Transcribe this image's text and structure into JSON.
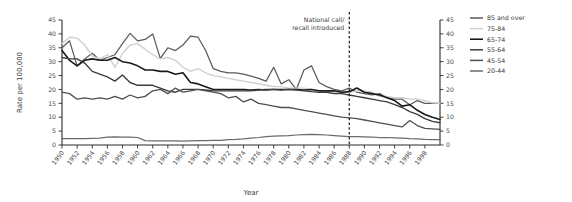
{
  "chart_data": {
    "type": "line",
    "title": "",
    "xlabel": "Year",
    "ylabel": "Rate per 100,000",
    "ylabel_right": "",
    "xlim": [
      1950,
      2000
    ],
    "ylim": [
      0,
      45
    ],
    "yticks": [
      0,
      5,
      10,
      15,
      20,
      25,
      30,
      35,
      40,
      45
    ],
    "xticks": [
      1950,
      1952,
      1954,
      1956,
      1958,
      1960,
      1962,
      1964,
      1966,
      1968,
      1970,
      1972,
      1974,
      1976,
      1978,
      1980,
      1982,
      1984,
      1986,
      1988,
      1990,
      1992,
      1994,
      1996,
      1998
    ],
    "grid": false,
    "legend_position": "top-right",
    "dual_y_axis": true,
    "x": [
      1950,
      1951,
      1952,
      1953,
      1954,
      1955,
      1956,
      1957,
      1958,
      1959,
      1960,
      1961,
      1962,
      1963,
      1964,
      1965,
      1966,
      1967,
      1968,
      1969,
      1970,
      1971,
      1972,
      1973,
      1974,
      1975,
      1976,
      1977,
      1978,
      1979,
      1980,
      1981,
      1982,
      1983,
      1984,
      1985,
      1986,
      1987,
      1988,
      1989,
      1990,
      1991,
      1992,
      1993,
      1994,
      1995,
      1996,
      1997,
      1998,
      1999,
      2000
    ],
    "series": [
      {
        "name": "85 and over",
        "color": "#5a5a5a",
        "width": 1.25,
        "values": [
          35.0,
          37.5,
          28.5,
          31.0,
          33.0,
          30.5,
          31.5,
          32.5,
          36.5,
          40.2,
          37.5,
          38.0,
          40.0,
          31.2,
          35.0,
          34.0,
          36.0,
          39.2,
          38.8,
          34.0,
          27.5,
          26.5,
          26.0,
          26.0,
          25.5,
          24.8,
          24.0,
          23.0,
          28.0,
          22.0,
          23.5,
          20.0,
          27.0,
          28.5,
          22.5,
          21.0,
          20.0,
          19.5,
          20.5,
          19.0,
          18.5,
          18.0,
          18.5,
          17.0,
          16.5,
          16.5,
          14.5,
          16.0,
          15.0,
          15.0,
          15.0
        ]
      },
      {
        "name": "75-84",
        "color": "#cfcfcf",
        "width": 1.35,
        "values": [
          36.5,
          38.8,
          38.5,
          36.0,
          32.0,
          31.0,
          32.5,
          28.0,
          33.0,
          36.0,
          36.5,
          34.5,
          32.5,
          31.0,
          31.5,
          30.5,
          28.0,
          26.5,
          27.5,
          26.0,
          25.0,
          24.5,
          24.0,
          23.5,
          23.0,
          22.5,
          22.0,
          21.5,
          21.0,
          21.0,
          20.5,
          20.5,
          20.5,
          20.0,
          19.5,
          19.5,
          19.0,
          19.0,
          19.0,
          19.5,
          19.5,
          19.0,
          17.5,
          17.5,
          17.0,
          17.0,
          16.5,
          16.5,
          16.0,
          15.2,
          15.0
        ]
      },
      {
        "name": "65-74",
        "color": "#1a1a1a",
        "width": 1.6,
        "values": [
          34.0,
          30.5,
          28.5,
          30.5,
          31.0,
          30.5,
          30.5,
          31.5,
          30.0,
          29.5,
          28.5,
          27.0,
          27.0,
          26.5,
          26.5,
          25.5,
          26.0,
          22.5,
          22.0,
          21.0,
          20.0,
          20.0,
          20.0,
          20.0,
          20.0,
          19.8,
          20.0,
          19.8,
          20.0,
          20.0,
          20.0,
          20.0,
          19.8,
          20.0,
          19.5,
          19.5,
          19.5,
          19.0,
          19.2,
          20.5,
          19.0,
          18.5,
          18.0,
          17.0,
          16.0,
          14.0,
          14.5,
          12.5,
          11.0,
          10.0,
          9.2
        ]
      },
      {
        "name": "55-64",
        "color": "#3c3c3c",
        "width": 1.35,
        "values": [
          31.5,
          31.0,
          31.0,
          29.5,
          26.5,
          25.5,
          24.5,
          23.0,
          25.2,
          22.5,
          21.5,
          21.5,
          21.5,
          20.5,
          19.5,
          19.0,
          20.0,
          20.0,
          20.0,
          19.8,
          19.5,
          19.5,
          19.5,
          19.5,
          19.5,
          19.5,
          19.8,
          20.0,
          20.0,
          19.8,
          20.0,
          19.8,
          19.5,
          19.2,
          19.0,
          19.0,
          18.5,
          18.5,
          18.0,
          17.5,
          17.0,
          16.5,
          16.0,
          15.5,
          14.5,
          13.5,
          12.0,
          11.0,
          9.5,
          8.5,
          8.0
        ]
      },
      {
        "name": "45-54",
        "color": "#4f4f4f",
        "width": 1.3,
        "values": [
          19.0,
          18.5,
          16.5,
          17.0,
          16.5,
          17.0,
          16.5,
          17.5,
          16.5,
          18.0,
          17.0,
          17.5,
          19.5,
          20.0,
          18.5,
          20.5,
          19.0,
          19.5,
          20.0,
          19.5,
          19.0,
          18.5,
          17.0,
          17.5,
          15.5,
          16.5,
          15.0,
          14.5,
          14.0,
          13.5,
          13.5,
          13.0,
          12.5,
          12.0,
          11.5,
          11.0,
          10.5,
          10.0,
          9.8,
          9.5,
          9.0,
          8.5,
          8.0,
          7.5,
          7.0,
          6.5,
          8.8,
          7.0,
          6.0,
          5.8,
          5.6
        ]
      },
      {
        "name": "20-44",
        "color": "#6a6a6a",
        "width": 1.25,
        "values": [
          2.3,
          2.3,
          2.3,
          2.3,
          2.4,
          2.5,
          2.8,
          2.9,
          2.8,
          2.8,
          2.7,
          1.6,
          1.5,
          1.5,
          1.5,
          1.5,
          1.4,
          1.5,
          1.6,
          1.6,
          1.7,
          1.7,
          1.9,
          2.0,
          2.2,
          2.5,
          2.7,
          3.0,
          3.2,
          3.3,
          3.4,
          3.6,
          3.7,
          3.8,
          3.7,
          3.6,
          3.4,
          3.2,
          3.0,
          3.0,
          2.9,
          2.8,
          2.7,
          2.7,
          2.6,
          2.5,
          2.3,
          2.2,
          2.0,
          1.9,
          1.9
        ]
      }
    ],
    "annotations": [
      {
        "name": "national-call-recall",
        "line1": "National call/",
        "line2": "recall introduced",
        "x": 1988,
        "style": "dashed-vertical"
      }
    ]
  },
  "legend": {
    "entries": [
      {
        "label": "85 and over"
      },
      {
        "label": "75-84"
      },
      {
        "label": "65-74"
      },
      {
        "label": "55-64"
      },
      {
        "label": "45-54"
      },
      {
        "label": "20-44"
      }
    ]
  }
}
